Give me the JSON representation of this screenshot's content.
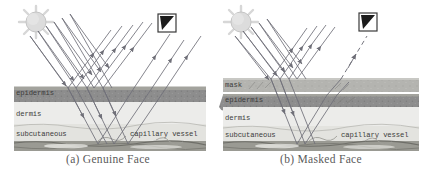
{
  "figure": {
    "type": "scientific-diagram"
  },
  "panels": [
    {
      "id": "a",
      "caption": "(a) Genuine Face",
      "icons": {
        "sun": "sun-icon",
        "camera": "camera-icon"
      },
      "layers": [
        {
          "name": "epidermis",
          "label": "epidermis",
          "color": "#8d8d8d"
        },
        {
          "name": "dermis",
          "label": "dermis",
          "color": "#ececea"
        },
        {
          "name": "subcutaneous",
          "label": "subcutaneous",
          "color": "#e3e3df"
        },
        {
          "name": "muscle",
          "label": "",
          "color": "#9a9a93"
        }
      ],
      "annotations": [
        {
          "name": "capillary-vessel",
          "label": "capillary vessel"
        }
      ]
    },
    {
      "id": "b",
      "caption": "(b) Masked Face",
      "icons": {
        "sun": "sun-icon",
        "camera": "camera-icon"
      },
      "layers": [
        {
          "name": "mask",
          "label": "mask",
          "color": "#b4b4b0"
        },
        {
          "name": "epidermis",
          "label": "epidermis",
          "color": "#8d8d8d"
        },
        {
          "name": "dermis",
          "label": "dermis",
          "color": "#ececea"
        },
        {
          "name": "subcutaneous",
          "label": "subcutaneous",
          "color": "#e3e3df"
        },
        {
          "name": "muscle",
          "label": "",
          "color": "#9a9a93"
        }
      ],
      "annotations": [
        {
          "name": "capillary-vessel",
          "label": "capillary vessel"
        }
      ]
    }
  ],
  "colors": {
    "ray": "#6f6f78",
    "ink": "#3b3b3b",
    "caption": "#5a5a5a",
    "sun": "#d9d9d9",
    "page": "#ffffff"
  }
}
